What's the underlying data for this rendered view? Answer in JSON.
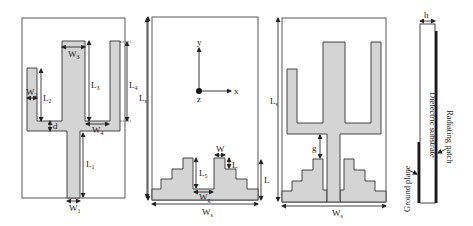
{
  "figure": {
    "panels": [
      {
        "id": "a",
        "name": "radiating-patch-top-view",
        "labels": {
          "W3": {
            "main": "W",
            "sub": "3"
          },
          "L3": {
            "main": "L",
            "sub": "3"
          },
          "L4": {
            "main": "L",
            "sub": "4"
          },
          "Ls": {
            "main": "L",
            "sub": "s"
          },
          "W2": {
            "main": "W",
            "sub": "2"
          },
          "L2": {
            "main": "L",
            "sub": "2"
          },
          "d": {
            "main": "d",
            "sub": ""
          },
          "W4": {
            "main": "W",
            "sub": "4"
          },
          "L1": {
            "main": "L",
            "sub": "1"
          },
          "W1": {
            "main": "W",
            "sub": "1"
          }
        }
      },
      {
        "id": "b",
        "name": "ground-plane-bottom-view",
        "labels": {
          "Ls": {
            "main": "L",
            "sub": "s"
          },
          "axis_y": "y",
          "axis_x": "x",
          "axis_z": "z",
          "W": {
            "main": "W",
            "sub": ""
          },
          "L_step": {
            "main": "L",
            "sub": ""
          },
          "L5": {
            "main": "L",
            "sub": "5"
          },
          "Wg": {
            "main": "W",
            "sub": "g"
          },
          "L": {
            "main": "L",
            "sub": ""
          },
          "Ws": {
            "main": "W",
            "sub": "s"
          }
        }
      },
      {
        "id": "c",
        "name": "combined-overlay-view",
        "labels": {
          "Ls": {
            "main": "L",
            "sub": "s"
          },
          "g": {
            "main": "g",
            "sub": ""
          },
          "Ws": {
            "main": "W",
            "sub": "s"
          }
        }
      },
      {
        "id": "d",
        "name": "side-view",
        "labels": {
          "h": "h",
          "substrate": "Dielectric substrate",
          "patch": "Radiating patch",
          "ground": "Ground plane"
        }
      }
    ],
    "colors": {
      "metal_fill": "#d4d4d4",
      "outline": "#333333",
      "dark_layer": "#1a1a1a"
    }
  }
}
